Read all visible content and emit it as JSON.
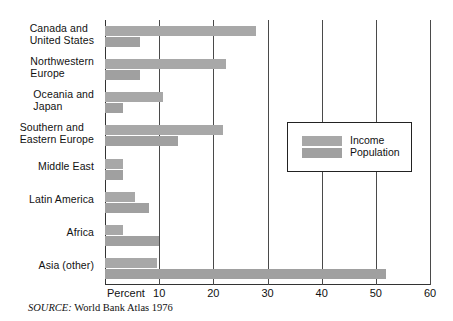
{
  "chart_data": {
    "type": "bar",
    "orientation": "horizontal",
    "title": "",
    "xlabel": "Percent",
    "ylabel": "",
    "xlim": [
      0,
      60
    ],
    "xticks": [
      10,
      20,
      30,
      40,
      50,
      60
    ],
    "xtick_labels": [
      "10",
      "20",
      "30",
      "40",
      "50",
      "60"
    ],
    "grid": true,
    "grid_axis": "x",
    "legend_position": "inside-right",
    "categories": [
      "Canada and\nUnited States",
      "Northwestern\nEurope",
      "Oceania and\nJapan",
      "Southern and\nEastern Europe",
      "Middle East",
      "Latin America",
      "Africa",
      "Asia (other)"
    ],
    "series": [
      {
        "name": "Income",
        "color": "#a8a8a8",
        "values": [
          27.8,
          22.4,
          10.7,
          21.7,
          3.3,
          5.6,
          3.3,
          9.6
        ]
      },
      {
        "name": "Population",
        "color": "#a0a0a0",
        "values": [
          6.5,
          6.5,
          3.3,
          13.5,
          3.3,
          8.1,
          10.0,
          51.8
        ]
      }
    ]
  },
  "axis": {
    "name_label": "Percent",
    "tick_labels": [
      "10",
      "20",
      "30",
      "40",
      "50",
      "60"
    ]
  },
  "category_labels": [
    {
      "line1": "Canada and",
      "line2": "United States"
    },
    {
      "line1": "Northwestern",
      "line2": "Europe"
    },
    {
      "line1": "Oceania and",
      "line2": "Japan"
    },
    {
      "line1": "Southern and",
      "line2": "Eastern Europe"
    },
    {
      "line1": "Middle East",
      "line2": ""
    },
    {
      "line1": "Latin America",
      "line2": ""
    },
    {
      "line1": "Africa",
      "line2": ""
    },
    {
      "line1": "Asia (other)",
      "line2": ""
    }
  ],
  "legend": {
    "income_label": "Income",
    "population_label": "Population"
  },
  "source": {
    "label": "SOURCE:",
    "text": " World Bank Atlas 1976"
  },
  "colors": {
    "income_bar": "#a8a8a8",
    "population_bar": "#a0a0a0",
    "axis": "#333333",
    "gridline": "#4a4a4a",
    "text": "#111111"
  }
}
